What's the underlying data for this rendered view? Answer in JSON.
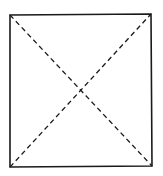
{
  "diagram": {
    "type": "square-with-diagonals",
    "stroke_color": "#1a1a1a",
    "background": "#ffffff",
    "square": {
      "corners": {
        "top_left": [
          10,
          15
        ],
        "top_right": [
          151,
          14
        ],
        "bottom_right": [
          152,
          166
        ],
        "bottom_left": [
          10,
          167
        ]
      },
      "line_style": "solid"
    },
    "diagonals": [
      {
        "from": "top_left",
        "to": "bottom_right",
        "line_style": "dashed"
      },
      {
        "from": "bottom_left",
        "to": "top_right",
        "line_style": "dashed"
      }
    ],
    "intersection": [
      80,
      90
    ]
  }
}
